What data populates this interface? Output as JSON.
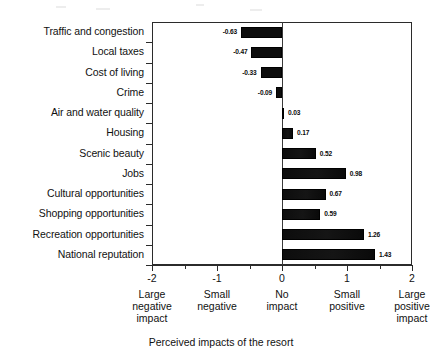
{
  "chart_data": {
    "type": "bar",
    "orientation": "horizontal",
    "title": "",
    "xlabel": "Perceived impacts of the resort",
    "ylabel": "",
    "xlim": [
      -2,
      2
    ],
    "grid": false,
    "legend": "none",
    "categories": [
      "Traffic and congestion",
      "Local taxes",
      "Cost of living",
      "Crime",
      "Air and water quality",
      "Housing",
      "Scenic beauty",
      "Jobs",
      "Cultural opportunities",
      "Shopping opportunities",
      "Recreation opportunities",
      "National reputation"
    ],
    "values": [
      -0.63,
      -0.47,
      -0.33,
      -0.09,
      0.03,
      0.17,
      0.52,
      0.98,
      0.67,
      0.59,
      1.26,
      1.43
    ],
    "value_labels": [
      "-0.63",
      "-0.47",
      "-0.33",
      "-0.09",
      "0.03",
      "0.17",
      "0.52",
      "0.98",
      "0.67",
      "0.59",
      "1.26",
      "1.43"
    ],
    "x_ticks": [
      -2,
      -1.5,
      -1,
      -0.5,
      0,
      0.5,
      1,
      1.5,
      2
    ],
    "x_tick_labels": [
      "-2",
      "",
      "-1",
      "",
      "0",
      "",
      "1",
      "",
      "2"
    ],
    "x_anchor_labels": [
      {
        "value": -2,
        "lines": [
          "Large",
          "negative",
          "impact"
        ]
      },
      {
        "value": -1,
        "lines": [
          "Small",
          "negative"
        ]
      },
      {
        "value": 0,
        "lines": [
          "No",
          "impact"
        ]
      },
      {
        "value": 1,
        "lines": [
          "Small",
          "positive"
        ]
      },
      {
        "value": 2,
        "lines": [
          "Large",
          "positive",
          "impact"
        ]
      }
    ],
    "bar_color": "#0d0d0d",
    "axis_color": "#2b2b2b",
    "background_color": "#ffffff"
  }
}
